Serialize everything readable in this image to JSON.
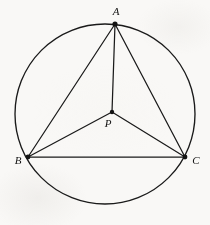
{
  "figure": {
    "background_color": "#f9f8f6",
    "ink_color": "#1a1a1a",
    "width": 210,
    "height": 225
  },
  "chart_data": {
    "type": "diagram",
    "title": "",
    "subtitle": "",
    "xlabel": "",
    "ylabel": "",
    "coordinate_space": {
      "units": "pixels",
      "origin": "top-left",
      "width": 210,
      "height": 225
    },
    "shapes": [
      {
        "kind": "circle",
        "name": "circumscribed-circle",
        "cx": 105,
        "cy": 114,
        "r": 90,
        "stroke": "#1a1a1a",
        "fill": "none"
      }
    ],
    "points": [
      {
        "id": "A",
        "label": "A",
        "x": 115,
        "y": 24,
        "on_circle": true,
        "label_x": 116,
        "label_y": 12,
        "dot": true
      },
      {
        "id": "B",
        "label": "B",
        "x": 28,
        "y": 157,
        "on_circle": true,
        "label_x": 18,
        "label_y": 161,
        "dot": true
      },
      {
        "id": "C",
        "label": "C",
        "x": 185,
        "y": 157,
        "on_circle": true,
        "label_x": 196,
        "label_y": 161,
        "dot": true
      },
      {
        "id": "P",
        "label": "P",
        "x": 112,
        "y": 112,
        "on_circle": false,
        "label_x": 108,
        "label_y": 124,
        "dot": true
      }
    ],
    "segments": [
      {
        "name": "side-AB",
        "from": "A",
        "to": "B"
      },
      {
        "name": "side-AC",
        "from": "A",
        "to": "C"
      },
      {
        "name": "side-BC",
        "from": "B",
        "to": "C"
      },
      {
        "name": "cevian-PA",
        "from": "P",
        "to": "A"
      },
      {
        "name": "cevian-PB",
        "from": "P",
        "to": "B"
      },
      {
        "name": "cevian-PC",
        "from": "P",
        "to": "C"
      }
    ],
    "legend": [],
    "annotations": [],
    "grid": false
  }
}
